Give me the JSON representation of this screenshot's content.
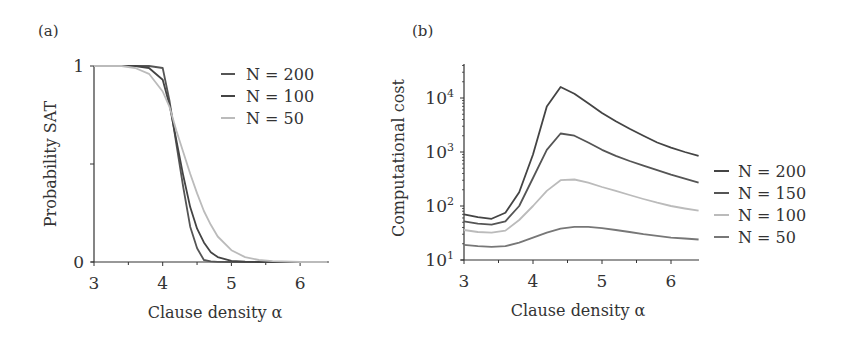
{
  "chart_data": [
    {
      "type": "line",
      "panel_label": "(a)",
      "title": "",
      "xlabel": "Clause density α",
      "ylabel": "Probability SAT",
      "xlim": [
        3,
        6.4
      ],
      "ylim": [
        0,
        1
      ],
      "xticks": [
        3,
        4,
        5,
        6
      ],
      "xtick_labels": [
        "3",
        "4",
        "5",
        "6"
      ],
      "yticks": [
        0,
        0.5,
        1
      ],
      "ytick_labels": [
        "0",
        "",
        "1"
      ],
      "legend_position": "top-right",
      "x": [
        3.0,
        3.2,
        3.4,
        3.6,
        3.8,
        4.0,
        4.1,
        4.2,
        4.3,
        4.4,
        4.5,
        4.6,
        4.7,
        4.8,
        5.0,
        5.2,
        5.4,
        5.6,
        6.0,
        6.4
      ],
      "series": [
        {
          "name": "N = 200",
          "color": "#555555",
          "values": [
            1,
            1,
            1,
            1,
            1,
            0.99,
            0.82,
            0.6,
            0.38,
            0.18,
            0.07,
            0.01,
            0.003,
            0.001,
            0,
            0,
            0,
            0,
            0,
            0
          ]
        },
        {
          "name": "N = 100",
          "color": "#444444",
          "values": [
            1,
            1,
            1,
            1,
            0.99,
            0.93,
            0.8,
            0.62,
            0.44,
            0.28,
            0.17,
            0.1,
            0.05,
            0.025,
            0.006,
            0.002,
            0,
            0,
            0,
            0
          ]
        },
        {
          "name": "N = 50",
          "color": "#bbbbbb",
          "values": [
            1,
            1,
            1,
            0.99,
            0.96,
            0.87,
            0.79,
            0.67,
            0.56,
            0.45,
            0.35,
            0.26,
            0.19,
            0.13,
            0.06,
            0.025,
            0.01,
            0.004,
            0,
            0
          ]
        }
      ]
    },
    {
      "type": "line",
      "panel_label": "(b)",
      "title": "",
      "xlabel": "Clause density α",
      "ylabel": "Computational cost",
      "yscale": "log",
      "xlim": [
        3,
        6.4
      ],
      "ylim": [
        10,
        40000
      ],
      "xticks": [
        3,
        4,
        5,
        6
      ],
      "xtick_labels": [
        "3",
        "4",
        "5",
        "6"
      ],
      "yticks": [
        10,
        100,
        1000,
        10000
      ],
      "ytick_labels": [
        [
          "10",
          "1"
        ],
        [
          "10",
          "2"
        ],
        [
          "10",
          "3"
        ],
        [
          "10",
          "4"
        ]
      ],
      "legend_position": "right",
      "x": [
        3.0,
        3.2,
        3.4,
        3.6,
        3.8,
        4.0,
        4.2,
        4.4,
        4.6,
        4.8,
        5.0,
        5.2,
        5.4,
        5.6,
        5.8,
        6.0,
        6.2,
        6.4
      ],
      "series": [
        {
          "name": "N = 200",
          "color": "#444444",
          "values": [
            70,
            62,
            58,
            75,
            180,
            900,
            7000,
            16000,
            12000,
            8000,
            5300,
            3700,
            2700,
            2000,
            1500,
            1200,
            1000,
            850
          ]
        },
        {
          "name": "N = 150",
          "color": "#555555",
          "values": [
            52,
            47,
            45,
            52,
            100,
            330,
            1100,
            2200,
            2000,
            1500,
            1100,
            850,
            680,
            560,
            460,
            380,
            320,
            270
          ]
        },
        {
          "name": "N = 100",
          "color": "#bbbbbb",
          "values": [
            36,
            33,
            32,
            35,
            55,
            100,
            190,
            300,
            310,
            270,
            225,
            190,
            160,
            135,
            115,
            100,
            90,
            82
          ]
        },
        {
          "name": "N = 50",
          "color": "#777777",
          "values": [
            19,
            18,
            17.5,
            18,
            21,
            26,
            32,
            38,
            41,
            41,
            39,
            36,
            33,
            30,
            28,
            26,
            25,
            24
          ]
        }
      ]
    }
  ]
}
